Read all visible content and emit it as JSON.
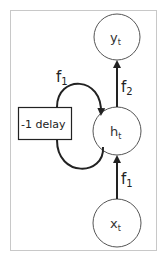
{
  "diagram": {
    "type": "recurrent-neural-network-unrolled-cell",
    "frame": {
      "border_color": "#c8c8c8"
    },
    "nodes": {
      "output": {
        "base": "y",
        "sub": "t"
      },
      "hidden": {
        "base": "h",
        "sub": "t"
      },
      "input": {
        "base": "x",
        "sub": "t"
      }
    },
    "delay_box": {
      "label": "-1 delay"
    },
    "edges": {
      "recurrent": {
        "base": "f",
        "sub": "1"
      },
      "hidden_to_output": {
        "base": "f",
        "sub": "2"
      },
      "input_to_hidden": {
        "base": "f",
        "sub": "1"
      }
    },
    "colors": {
      "stroke": "#222222",
      "node_stroke": "#555555",
      "text": "#333333"
    }
  }
}
